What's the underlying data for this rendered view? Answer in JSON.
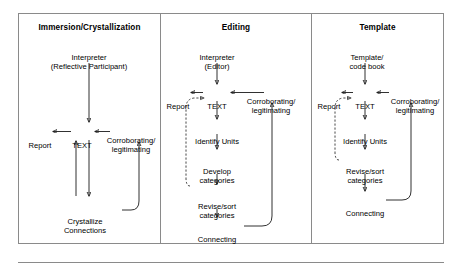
{
  "figure": {
    "title_row": {
      "panels": [
        {
          "key": "immersion",
          "label": "Immersion/Crystallization"
        },
        {
          "key": "editing",
          "label": "Editing"
        },
        {
          "key": "template",
          "label": "Template"
        }
      ]
    },
    "panels": [
      {
        "key": "immersion",
        "title": "Immersion/Crystallization",
        "nodes": {
          "interpreter_line1": "Interpreter",
          "interpreter_line2": "(Reflective Participant)",
          "report": "Report",
          "text": "TEXT",
          "corroborating_line1": "Corroborating/",
          "corroborating_line2": "legitimating",
          "crystallize_line1": "Crystallize",
          "crystallize_line2": "Connections"
        }
      },
      {
        "key": "editing",
        "title": "Editing",
        "nodes": {
          "interpreter_line1": "Interpreter",
          "interpreter_line2": "(Editor)",
          "report": "Report",
          "text": "TEXT",
          "corroborating_line1": "Corroborating/",
          "corroborating_line2": "legitimating",
          "identify_units": "Identify Units",
          "develop_line1": "Develop",
          "develop_line2": "categories",
          "revise_line1": "Revise/sort",
          "revise_line2": "categories",
          "connecting": "Connecting"
        }
      },
      {
        "key": "template",
        "title": "Template",
        "nodes": {
          "source_line1": "Template/",
          "source_line2": "code book",
          "report": "Report",
          "text": "TEXT",
          "corroborating_line1": "Corroborating/",
          "corroborating_line2": "legitimating",
          "identify_units": "Identify Units",
          "revise_line1": "Revise/sort",
          "revise_line2": "categories",
          "connecting": "Connecting"
        }
      }
    ],
    "colors": {
      "frame": "#8a8a8a",
      "wire": "#1a1a1a",
      "text": "#000000",
      "background": "#ffffff"
    }
  }
}
